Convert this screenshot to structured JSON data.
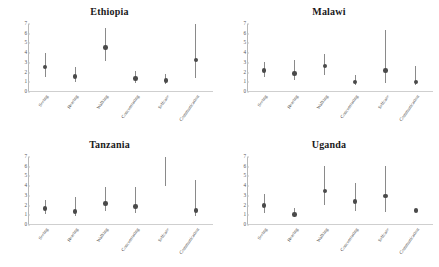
{
  "figure": {
    "layout": "2x2 grid of error-bar panels",
    "panel_order": [
      "Ethiopia",
      "Malawi",
      "Tanzania",
      "Uganda"
    ]
  },
  "chart_data": [
    {
      "type": "scatter",
      "title": "Ethiopia",
      "xlabel": "",
      "ylabel": "",
      "ylim": [
        0,
        7
      ],
      "yticks": [
        0,
        1,
        2,
        3,
        4,
        5,
        6,
        7
      ],
      "grid": false,
      "legend": "none",
      "categories": [
        "Seeing",
        "Hearing",
        "Walking",
        "Concentrating",
        "Selfcare",
        "Communication"
      ],
      "series": [
        {
          "name": "Estimate",
          "values": [
            2.6,
            1.6,
            4.6,
            1.4,
            1.2,
            3.3
          ],
          "ci_low": [
            1.5,
            1.0,
            3.2,
            0.9,
            0.8,
            1.4
          ],
          "ci_high": [
            4.0,
            2.6,
            6.6,
            2.2,
            1.9,
            7.0
          ]
        }
      ]
    },
    {
      "type": "scatter",
      "title": "Malawi",
      "xlabel": "",
      "ylabel": "",
      "ylim": [
        0,
        7
      ],
      "yticks": [
        0,
        1,
        2,
        3,
        4,
        5,
        6,
        7
      ],
      "grid": false,
      "legend": "none",
      "categories": [
        "Seeing",
        "Hearing",
        "Walking",
        "Concentrating",
        "Selfcare",
        "Communication"
      ],
      "series": [
        {
          "name": "Estimate",
          "values": [
            2.2,
            1.9,
            2.7,
            1.0,
            2.2,
            1.0
          ],
          "ci_low": [
            1.5,
            1.2,
            1.8,
            0.7,
            0.9,
            0.7
          ],
          "ci_high": [
            3.1,
            3.3,
            3.9,
            1.7,
            6.4,
            2.7
          ]
        }
      ]
    },
    {
      "type": "scatter",
      "title": "Tanzania",
      "xlabel": "",
      "ylabel": "",
      "ylim": [
        0,
        7
      ],
      "yticks": [
        0,
        1,
        2,
        3,
        4,
        5,
        6,
        7
      ],
      "grid": false,
      "legend": "none",
      "categories": [
        "Seeing",
        "Hearing",
        "Walking",
        "Concentrating",
        "Selfcare",
        "Communication"
      ],
      "series": [
        {
          "name": "Estimate",
          "values": [
            1.7,
            1.4,
            2.2,
            1.9,
            null,
            1.5
          ],
          "ci_low": [
            1.1,
            0.9,
            1.4,
            1.2,
            4.0,
            0.9
          ],
          "ci_high": [
            2.6,
            2.9,
            3.9,
            3.9,
            7.0,
            4.6
          ]
        }
      ]
    },
    {
      "type": "scatter",
      "title": "Uganda",
      "xlabel": "",
      "ylabel": "",
      "ylim": [
        0,
        7
      ],
      "yticks": [
        0,
        1,
        2,
        3,
        4,
        5,
        6,
        7
      ],
      "grid": false,
      "legend": "none",
      "categories": [
        "Seeing",
        "Hearing",
        "Walking",
        "Concentrating",
        "Selfcare",
        "Communication"
      ],
      "series": [
        {
          "name": "Estimate",
          "values": [
            2.0,
            1.1,
            3.5,
            2.4,
            3.0,
            1.5
          ],
          "ci_low": [
            1.2,
            0.8,
            2.1,
            1.4,
            1.3,
            1.5
          ],
          "ci_high": [
            3.2,
            1.8,
            6.1,
            4.3,
            6.1,
            1.5
          ]
        }
      ]
    }
  ],
  "style": {
    "marker_color": "#4a4a4a",
    "line_color": "#8a8a8a",
    "axis_color": "#c3c3c3",
    "title_color": "#1a1a1a",
    "background": "#ffffff"
  }
}
